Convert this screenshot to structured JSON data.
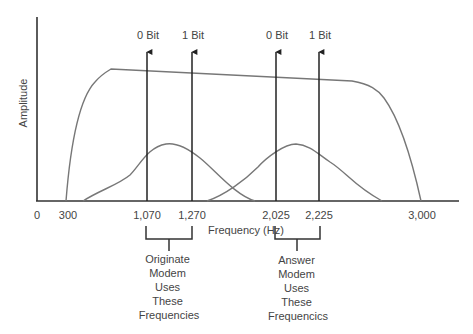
{
  "diagram": {
    "axes": {
      "y_label": "Amplitude",
      "x_label": "Frequency (Hz)",
      "x_ticks": [
        {
          "label": "0",
          "x": 37
        },
        {
          "label": "300",
          "x": 66
        },
        {
          "label": "1,070",
          "x": 147
        },
        {
          "label": "1,270",
          "x": 192
        },
        {
          "label": "2,025",
          "x": 276
        },
        {
          "label": "2,225",
          "x": 319
        },
        {
          "label": "3,000",
          "x": 421
        }
      ]
    },
    "carriers": [
      {
        "label": "0 Bit",
        "frequency": "1,070",
        "x": 147
      },
      {
        "label": "1 Bit",
        "frequency": "1,270",
        "x": 192
      },
      {
        "label": "0 Bit",
        "frequency": "2,025",
        "x": 276
      },
      {
        "label": "1 Bit",
        "frequency": "2,225",
        "x": 319
      }
    ],
    "curves": [
      {
        "name": "voice-channel-passband",
        "from": "300",
        "to": "3,000"
      },
      {
        "name": "originate-band",
        "from": "1,070",
        "to": "1,270"
      },
      {
        "name": "answer-band",
        "from": "2,025",
        "to": "2,225"
      }
    ],
    "brackets": [
      {
        "name": "originate",
        "lines": [
          "Originate",
          "Modem",
          "Uses",
          "These",
          "Frequencies"
        ]
      },
      {
        "name": "answer",
        "lines": [
          "Answer",
          "Modem",
          "Uses",
          "These",
          "Frequencics"
        ]
      }
    ],
    "colors": {
      "axis": "#333333",
      "curve": "#777777",
      "text": "#444444",
      "background": "#ffffff"
    }
  }
}
